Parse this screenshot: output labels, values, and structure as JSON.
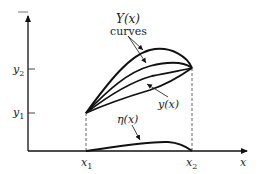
{
  "diagram": {
    "type": "variational-calculus-curves",
    "axes": {
      "x_label": "x",
      "y_ticks": [
        {
          "label_main": "y",
          "label_sub": "1",
          "name": "y1"
        },
        {
          "label_main": "y",
          "label_sub": "2",
          "name": "y2"
        }
      ],
      "x_ticks": [
        {
          "label_main": "x",
          "label_sub": "1",
          "name": "x1"
        },
        {
          "label_main": "x",
          "label_sub": "2",
          "name": "x2"
        }
      ]
    },
    "labels": {
      "family_curves_line1": "Y(x)",
      "family_curves_line2": "curves",
      "extremal": "y(x)",
      "variation": "η(x)"
    },
    "colors": {
      "stroke": "#111111",
      "dashed": "#555555",
      "background": "#ffffff"
    }
  }
}
